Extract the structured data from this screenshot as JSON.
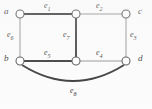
{
  "figure": {
    "type": "graph-diagram",
    "width": 152,
    "height": 109,
    "background_color": "#fcfcfc",
    "stroke_color": "#5a5a5a",
    "label_color": "#2b2b2b"
  },
  "vertices": [
    {
      "id": "a",
      "label": "a",
      "x": 20,
      "y": 14,
      "label_x": 4,
      "label_y": 8
    },
    {
      "id": "m_top",
      "label": "",
      "x": 76,
      "y": 14,
      "label_x": 0,
      "label_y": 0
    },
    {
      "id": "c",
      "label": "c",
      "x": 126,
      "y": 14,
      "label_x": 138,
      "label_y": 8
    },
    {
      "id": "b",
      "label": "b",
      "x": 20,
      "y": 61,
      "label_x": 4,
      "label_y": 55
    },
    {
      "id": "m_bot",
      "label": "",
      "x": 76,
      "y": 61,
      "label_x": 0,
      "label_y": 0
    },
    {
      "id": "d",
      "label": "d",
      "x": 126,
      "y": 61,
      "label_x": 138,
      "label_y": 55
    }
  ],
  "edges": [
    {
      "id": "e1",
      "label": "e",
      "sub": "1",
      "from": "a",
      "to": "m_top",
      "weight": "thick",
      "label_x": 44,
      "label_y": 3
    },
    {
      "id": "e2",
      "label": "e",
      "sub": "2",
      "from": "m_top",
      "to": "c",
      "weight": "thin",
      "label_x": 96,
      "label_y": 3
    },
    {
      "id": "e3",
      "label": "e",
      "sub": "3",
      "from": "c",
      "to": "d",
      "weight": "thin",
      "label_x": 130,
      "label_y": 33
    },
    {
      "id": "e4",
      "label": "e",
      "sub": "4",
      "from": "m_bot",
      "to": "d",
      "weight": "thin",
      "label_x": 96,
      "label_y": 50
    },
    {
      "id": "e5",
      "label": "e",
      "sub": "5",
      "from": "b",
      "to": "m_bot",
      "weight": "thick",
      "label_x": 44,
      "label_y": 50
    },
    {
      "id": "e6",
      "label": "e",
      "sub": "6",
      "from": "a",
      "to": "b",
      "weight": "thin",
      "label_x": 8,
      "label_y": 33
    },
    {
      "id": "e7",
      "label": "e",
      "sub": "7",
      "from": "m_top",
      "to": "m_bot",
      "weight": "thick",
      "label_x": 64,
      "label_y": 33
    },
    {
      "id": "e8",
      "label": "e",
      "sub": "8",
      "from": "b",
      "to": "d",
      "weight": "thick",
      "curved": true,
      "label_x": 70,
      "label_y": 88
    }
  ]
}
